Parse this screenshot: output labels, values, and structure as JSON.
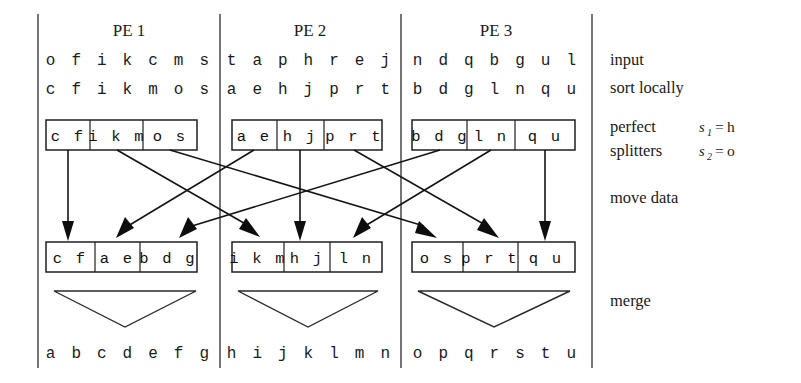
{
  "figure": {
    "title_hidden": "Parallel sample sort with perfect splitters across 3 PEs",
    "columns": [
      {
        "id": "pe1",
        "title": "PE 1",
        "input": "o f i k c m s",
        "sorted": "c f i k m o s",
        "split_cells": [
          "c f",
          "i k m",
          "o s"
        ],
        "received_cells": [
          "c f",
          "a e",
          "b d g"
        ],
        "merged": "a b c d e f g"
      },
      {
        "id": "pe2",
        "title": "PE 2",
        "input": "t a p h r e j",
        "sorted": "a e h j p r t",
        "split_cells": [
          "a e",
          "h j",
          "p r t"
        ],
        "received_cells": [
          "i k m",
          "h j",
          "l n"
        ],
        "merged": "h i j k l m n"
      },
      {
        "id": "pe3",
        "title": "PE 3",
        "input": "n d q b g u l",
        "sorted": "b d g l n q u",
        "split_cells": [
          "b d g",
          "l n",
          "q u"
        ],
        "received_cells": [
          "o s",
          "p r t",
          "q u"
        ],
        "merged": "o p q r s t u"
      }
    ],
    "row_labels": {
      "input": "input",
      "sort_locally": "sort locally",
      "perfect": "perfect",
      "splitters": "splitters",
      "move_data": "move data",
      "merge": "merge"
    },
    "splitters": [
      {
        "symbol": "s",
        "subscript": "1",
        "equals": "=",
        "value": "h"
      },
      {
        "symbol": "s",
        "subscript": "2",
        "equals": "=",
        "value": "o"
      }
    ],
    "colors": {
      "ink": "#1a1a1a",
      "line": "#1f1f1f",
      "background": "#ffffff"
    }
  }
}
